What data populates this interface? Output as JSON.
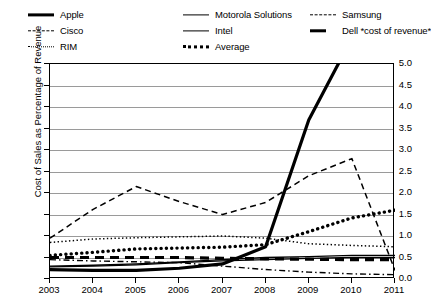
{
  "chart_data": {
    "type": "line",
    "title": "",
    "xlabel": "",
    "ylabel": "Cost of Sales as Percentage of Revenue",
    "x": [
      2003,
      2004,
      2005,
      2006,
      2007,
      2008,
      2009,
      2010,
      2011
    ],
    "xlim": [
      2003,
      2011
    ],
    "ylim": [
      0.0,
      5.0
    ],
    "yticks": [
      "0.0",
      "0.5",
      "1.0",
      "1.5",
      "2.0",
      "2.5",
      "3.0",
      "3.5",
      "4.0",
      "4.5",
      "5.0"
    ],
    "xticks": [
      "2003",
      "2004",
      "2005",
      "2006",
      "2007",
      "2008",
      "2009",
      "2010",
      "2011"
    ],
    "grid": true,
    "legend_position": "above-plot",
    "series": [
      {
        "name": "Apple",
        "style": "thick-solid",
        "values": [
          0.22,
          0.2,
          0.2,
          0.25,
          0.35,
          0.75,
          3.7,
          5.6,
          7.4
        ],
        "note": "rises off the top of the axis between 2009 and 2010"
      },
      {
        "name": "Cisco",
        "style": "dashed",
        "values": [
          0.95,
          1.62,
          2.15,
          1.8,
          1.5,
          1.78,
          2.4,
          2.8,
          0.2
        ]
      },
      {
        "name": "RIM",
        "style": "dotted",
        "values": [
          0.85,
          0.93,
          0.96,
          0.98,
          1.0,
          0.95,
          0.82,
          0.78,
          0.75
        ]
      },
      {
        "name": "Motorola Solutions",
        "style": "thin-solid",
        "values": [
          0.3,
          0.32,
          0.35,
          0.4,
          0.45,
          0.5,
          0.52,
          0.55,
          0.55
        ]
      },
      {
        "name": "Intel",
        "style": "thin-solid",
        "values": [
          0.28,
          0.3,
          0.33,
          0.38,
          0.42,
          0.45,
          0.48,
          0.5,
          0.5
        ]
      },
      {
        "name": "Average",
        "style": "thick-dotted",
        "values": [
          0.55,
          0.62,
          0.7,
          0.72,
          0.74,
          0.8,
          1.1,
          1.42,
          1.6
        ]
      },
      {
        "name": "Samsung",
        "style": "dash-dot",
        "values": [
          0.45,
          0.42,
          0.4,
          0.38,
          0.3,
          0.22,
          0.16,
          0.12,
          0.1
        ]
      },
      {
        "name": "Dell *cost of revenue*",
        "style": "thick-dashed",
        "values": [
          0.5,
          0.5,
          0.5,
          0.5,
          0.48,
          0.47,
          0.46,
          0.45,
          0.45
        ]
      }
    ]
  },
  "legend": {
    "items": [
      {
        "label": "Apple",
        "style": "s-thick"
      },
      {
        "label": "Cisco",
        "style": "s-dash"
      },
      {
        "label": "RIM",
        "style": "s-dot"
      },
      {
        "label": "Motorola Solutions",
        "style": "s-thin"
      },
      {
        "label": "Intel",
        "style": "s-thin"
      },
      {
        "label": "Average",
        "style": "s-thickdot"
      },
      {
        "label": "Samsung",
        "style": "s-dashdot"
      },
      {
        "label": "Dell *cost of revenue*",
        "style": "s-thickdash"
      }
    ]
  },
  "colors": {
    "line": "#000000",
    "grid": "#9a9a9a",
    "axis": "#000000",
    "background": "#ffffff"
  }
}
